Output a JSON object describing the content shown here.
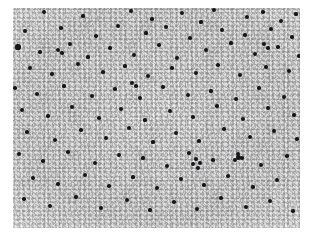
{
  "page": {
    "background_color": "#ffffff",
    "width": 317,
    "height": 245
  },
  "image": {
    "kind": "photomicrograph",
    "alt_text": "Grayscale photomicrograph of mottled granular tissue with scattered dark silver grains",
    "caption": "",
    "frame": {
      "x": 13,
      "y": 8,
      "width": 287,
      "height": 220
    },
    "palette": {
      "background": "#ffffff",
      "tissue_light": "#e8e8e8",
      "tissue_mid": "#c6c6c6",
      "tissue_dark": "#9a9a9a",
      "grain_dark": "#15161a"
    },
    "texture": {
      "description": "fine irregular gray speckle, mottled clumping at ~10-20px scale",
      "grain_count": 118
    },
    "grains": [
      [
        44,
        12,
        1.9
      ],
      [
        83,
        16,
        1.6
      ],
      [
        131,
        11,
        2.0
      ],
      [
        152,
        19,
        1.7
      ],
      [
        182,
        13,
        2.2
      ],
      [
        201,
        22,
        1.6
      ],
      [
        214,
        10,
        1.9
      ],
      [
        247,
        17,
        2.1
      ],
      [
        263,
        12,
        1.7
      ],
      [
        281,
        21,
        2.0
      ],
      [
        296,
        14,
        1.6
      ],
      [
        25,
        31,
        2.3
      ],
      [
        61,
        28,
        1.8
      ],
      [
        96,
        36,
        1.7
      ],
      [
        118,
        26,
        2.0
      ],
      [
        146,
        33,
        1.6
      ],
      [
        166,
        27,
        2.4
      ],
      [
        190,
        38,
        1.8
      ],
      [
        222,
        30,
        1.9
      ],
      [
        245,
        35,
        1.7
      ],
      [
        271,
        29,
        2.2
      ],
      [
        292,
        37,
        1.8
      ],
      [
        18,
        47,
        2.6
      ],
      [
        40,
        52,
        1.7
      ],
      [
        70,
        44,
        2.0
      ],
      [
        88,
        57,
        1.6
      ],
      [
        110,
        48,
        1.8
      ],
      [
        134,
        55,
        2.1
      ],
      [
        159,
        45,
        1.7
      ],
      [
        177,
        58,
        1.9
      ],
      [
        206,
        50,
        2.3
      ],
      [
        231,
        43,
        1.6
      ],
      [
        255,
        54,
        2.0
      ],
      [
        278,
        47,
        1.8
      ],
      [
        299,
        56,
        1.7
      ],
      [
        30,
        68,
        1.9
      ],
      [
        52,
        74,
        1.7
      ],
      [
        78,
        64,
        2.2
      ],
      [
        103,
        72,
        1.8
      ],
      [
        125,
        66,
        1.6
      ],
      [
        148,
        76,
        2.0
      ],
      [
        172,
        68,
        1.7
      ],
      [
        196,
        73,
        2.4
      ],
      [
        218,
        65,
        1.8
      ],
      [
        240,
        75,
        1.9
      ],
      [
        266,
        67,
        1.7
      ],
      [
        289,
        71,
        2.1
      ],
      [
        15,
        88,
        1.8
      ],
      [
        37,
        94,
        2.0
      ],
      [
        64,
        86,
        1.6
      ],
      [
        92,
        96,
        2.3
      ],
      [
        115,
        89,
        1.7
      ],
      [
        140,
        98,
        1.9
      ],
      [
        163,
        87,
        1.8
      ],
      [
        188,
        95,
        2.0
      ],
      [
        211,
        91,
        1.6
      ],
      [
        236,
        99,
        2.2
      ],
      [
        259,
        88,
        1.7
      ],
      [
        284,
        97,
        1.9
      ],
      [
        22,
        110,
        2.1
      ],
      [
        48,
        116,
        1.7
      ],
      [
        72,
        107,
        1.9
      ],
      [
        99,
        118,
        1.8
      ],
      [
        121,
        109,
        2.3
      ],
      [
        145,
        120,
        1.6
      ],
      [
        170,
        111,
        2.0
      ],
      [
        193,
        117,
        1.8
      ],
      [
        217,
        106,
        1.7
      ],
      [
        243,
        119,
        2.1
      ],
      [
        268,
        108,
        1.9
      ],
      [
        294,
        115,
        1.7
      ],
      [
        27,
        132,
        1.8
      ],
      [
        55,
        140,
        2.2
      ],
      [
        81,
        130,
        1.7
      ],
      [
        106,
        138,
        1.9
      ],
      [
        129,
        128,
        2.0
      ],
      [
        153,
        142,
        1.6
      ],
      [
        176,
        133,
        2.4
      ],
      [
        199,
        141,
        1.8
      ],
      [
        224,
        129,
        1.7
      ],
      [
        250,
        137,
        2.0
      ],
      [
        274,
        131,
        1.9
      ],
      [
        297,
        139,
        1.8
      ],
      [
        19,
        154,
        2.0
      ],
      [
        43,
        161,
        1.8
      ],
      [
        68,
        152,
        1.7
      ],
      [
        95,
        163,
        2.1
      ],
      [
        119,
        155,
        1.9
      ],
      [
        143,
        158,
        1.6
      ],
      [
        167,
        166,
        2.3
      ],
      [
        189,
        153,
        1.8
      ],
      [
        213,
        160,
        1.7
      ],
      [
        238,
        157,
        2.5
      ],
      [
        261,
        165,
        1.9
      ],
      [
        287,
        156,
        1.8
      ],
      [
        33,
        178,
        1.9
      ],
      [
        58,
        184,
        1.7
      ],
      [
        85,
        175,
        2.2
      ],
      [
        109,
        186,
        1.8
      ],
      [
        133,
        177,
        1.6
      ],
      [
        157,
        188,
        2.0
      ],
      [
        181,
        179,
        1.9
      ],
      [
        204,
        185,
        1.7
      ],
      [
        228,
        176,
        2.1
      ],
      [
        253,
        187,
        1.8
      ],
      [
        277,
        180,
        1.9
      ],
      [
        24,
        199,
        1.8
      ],
      [
        50,
        206,
        2.0
      ],
      [
        76,
        197,
        1.7
      ],
      [
        101,
        208,
        1.9
      ],
      [
        127,
        200,
        2.2
      ],
      [
        150,
        210,
        1.6
      ],
      [
        174,
        202,
        1.8
      ],
      [
        197,
        209,
        2.0
      ],
      [
        221,
        198,
        1.7
      ],
      [
        246,
        207,
        1.9
      ],
      [
        270,
        201,
        2.1
      ],
      [
        293,
        211,
        1.7
      ]
    ],
    "grain_clusters": [
      [
        196,
        159,
        2.3
      ],
      [
        200,
        163,
        2.0
      ],
      [
        193,
        164,
        1.9
      ],
      [
        198,
        168,
        2.1
      ],
      [
        238,
        154,
        2.0
      ],
      [
        242,
        158,
        1.8
      ],
      [
        235,
        160,
        1.9
      ],
      [
        132,
        83,
        2.1
      ],
      [
        136,
        86,
        1.8
      ],
      [
        58,
        50,
        2.4
      ],
      [
        62,
        53,
        1.7
      ],
      [
        264,
        44,
        2.0
      ],
      [
        268,
        48,
        1.8
      ]
    ]
  }
}
